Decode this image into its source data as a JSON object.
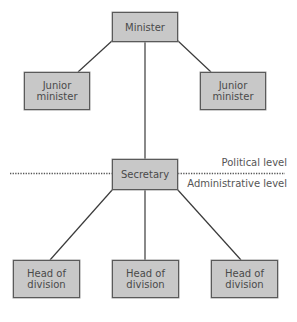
{
  "diagram": {
    "type": "org-chart",
    "nodes": {
      "minister": {
        "label": "Minister"
      },
      "junior_left": {
        "label": "Junior\nminister"
      },
      "junior_right": {
        "label": "Junior\nminister"
      },
      "secretary": {
        "label": "Secretary"
      },
      "head_left": {
        "label": "Head of\ndivision"
      },
      "head_middle": {
        "label": "Head of\ndivision"
      },
      "head_right": {
        "label": "Head of\ndivision"
      }
    },
    "edges": [
      [
        "minister",
        "junior_left"
      ],
      [
        "minister",
        "junior_right"
      ],
      [
        "minister",
        "secretary"
      ],
      [
        "secretary",
        "head_left"
      ],
      [
        "secretary",
        "head_middle"
      ],
      [
        "secretary",
        "head_right"
      ]
    ],
    "levels": {
      "political": "Political level",
      "administrative": "Administrative level"
    },
    "colors": {
      "box_fill": "#c8c8c8",
      "box_border": "#5a5a5a",
      "line": "#3a3a3a",
      "text": "#4a4a4a"
    }
  }
}
